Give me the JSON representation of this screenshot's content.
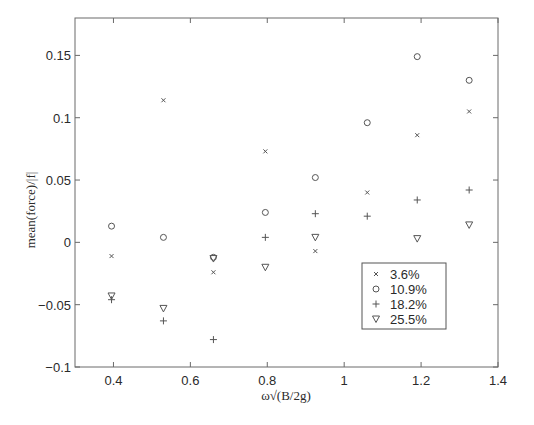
{
  "chart_data": {
    "type": "scatter",
    "title": "",
    "xlabel": "ω√(B/2g)",
    "ylabel": "mean(force)/|f|",
    "xlim": [
      0.3,
      1.4
    ],
    "ylim": [
      -0.1,
      0.18
    ],
    "xticks": [
      0.4,
      0.6,
      0.8,
      1.0,
      1.2,
      1.4
    ],
    "xtick_labels": [
      "0.4",
      "0.6",
      "0.8",
      "1",
      "1.2",
      "1.4"
    ],
    "yticks": [
      -0.1,
      -0.05,
      0,
      0.05,
      0.1,
      0.15
    ],
    "ytick_labels": [
      "−0.1",
      "−0.05",
      "0",
      "0.05",
      "0.1",
      "0.15"
    ],
    "grid": false,
    "legend_position": "lower right (inside)",
    "series": [
      {
        "name": "3.6%",
        "marker": "x",
        "x": [
          0.395,
          0.53,
          0.66,
          0.795,
          0.925,
          1.06,
          1.19,
          1.325
        ],
        "y": [
          -0.011,
          0.114,
          -0.024,
          0.073,
          -0.007,
          0.04,
          0.086,
          0.105
        ]
      },
      {
        "name": "10.9%",
        "marker": "circle",
        "x": [
          0.395,
          0.53,
          0.66,
          0.795,
          0.925,
          1.06,
          1.19,
          1.325
        ],
        "y": [
          0.013,
          0.004,
          -0.012,
          0.024,
          0.052,
          0.096,
          0.149,
          0.13
        ]
      },
      {
        "name": "18.2%",
        "marker": "plus",
        "x": [
          0.395,
          0.53,
          0.66,
          0.795,
          0.925,
          1.06,
          1.19,
          1.325
        ],
        "y": [
          -0.046,
          -0.063,
          -0.078,
          0.004,
          0.023,
          0.021,
          0.034,
          0.042
        ]
      },
      {
        "name": "25.5%",
        "marker": "triangle-down",
        "x": [
          0.395,
          0.53,
          0.66,
          0.795,
          0.925,
          1.19,
          1.325
        ],
        "y": [
          -0.043,
          -0.053,
          -0.013,
          -0.02,
          0.004,
          0.003,
          0.014
        ]
      }
    ]
  },
  "legend": {
    "items": [
      "3.6%",
      "10.9%",
      "18.2%",
      "25.5%"
    ]
  }
}
